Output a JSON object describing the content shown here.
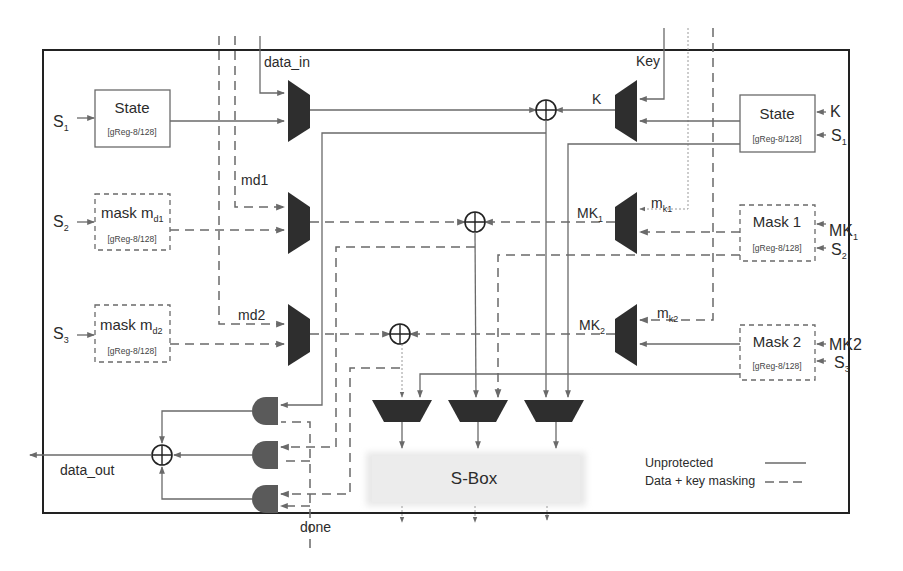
{
  "diagram": {
    "inputs": {
      "data_in": "data_in",
      "key": "Key",
      "md1": "md1",
      "md2": "md2",
      "mk1": {
        "base": "m",
        "sub": "k1"
      },
      "mk2": {
        "base": "m",
        "sub": "k2"
      }
    },
    "left_registers": [
      {
        "name": "State",
        "sub": "[gReg-8/128]",
        "select": {
          "base": "S",
          "sub": "1"
        },
        "style": "solid"
      },
      {
        "name": "mask m",
        "name_sub": "d1",
        "sub": "[gReg-8/128]",
        "select": {
          "base": "S",
          "sub": "2"
        },
        "style": "dashed"
      },
      {
        "name": "mask m",
        "name_sub": "d2",
        "sub": "[gReg-8/128]",
        "select": {
          "base": "S",
          "sub": "3"
        },
        "style": "dashed"
      }
    ],
    "right_registers": [
      {
        "name": "State",
        "sub": "[gReg-8/128]",
        "inputs": [
          {
            "base": "K",
            "sub": ""
          },
          {
            "base": "S",
            "sub": "1"
          }
        ],
        "style": "solid"
      },
      {
        "name": "Mask 1",
        "sub": "[gReg-8/128]",
        "inputs": [
          {
            "base": "MK",
            "sub": "1"
          },
          {
            "base": "S",
            "sub": "2"
          }
        ],
        "style": "dashed"
      },
      {
        "name": "Mask 2",
        "sub": "[gReg-8/128]",
        "inputs": [
          {
            "base": "MK2",
            "sub": ""
          },
          {
            "base": "S",
            "sub": "3"
          }
        ],
        "style": "dashed"
      }
    ],
    "key_mux_outputs": [
      {
        "base": "K",
        "sub": ""
      },
      {
        "base": "MK",
        "sub": "1"
      },
      {
        "base": "MK",
        "sub": "2"
      }
    ],
    "sbox_label": "S-Box",
    "output": {
      "data_out": "data_out",
      "done": "done"
    },
    "legend": [
      {
        "label": "Unprotected",
        "style": "solid"
      },
      {
        "label": "Data + key masking",
        "style": "dashed"
      }
    ],
    "colors": {
      "line": "#6a6a6a",
      "mux_fill": "#2e2e2e",
      "gate_fill": "#5a5a5a",
      "frame": "#222222",
      "sbox_fill": "#ececec"
    }
  }
}
